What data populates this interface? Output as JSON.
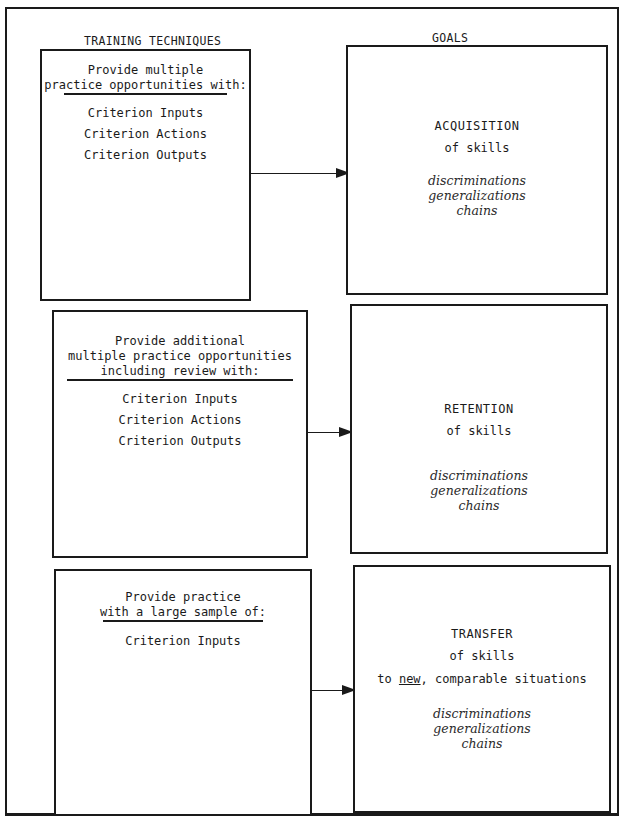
{
  "headers": {
    "left": "TRAINING TECHNIQUES",
    "right": "GOALS"
  },
  "rows": [
    {
      "technique": {
        "intro_lines": [
          "Provide multiple",
          "practice opportunities with:"
        ],
        "items": [
          "Criterion Inputs",
          "Criterion Actions",
          "Criterion Outputs"
        ]
      },
      "goal": {
        "title": "ACQUISITION",
        "subtitle": "of skills",
        "extra": "",
        "skill_types": [
          "discriminations",
          "generalizations",
          "chains"
        ]
      }
    },
    {
      "technique": {
        "intro_lines": [
          "Provide additional",
          "multiple practice opportunities",
          "including review with:"
        ],
        "items": [
          "Criterion Inputs",
          "Criterion Actions",
          "Criterion Outputs"
        ]
      },
      "goal": {
        "title": "RETENTION",
        "subtitle": "of skills",
        "extra": "",
        "skill_types": [
          "discriminations",
          "generalizations",
          "chains"
        ]
      }
    },
    {
      "technique": {
        "intro_lines": [
          "Provide practice",
          "with a large sample of:"
        ],
        "items": [
          "Criterion Inputs"
        ]
      },
      "goal": {
        "title": "TRANSFER",
        "subtitle": "of skills",
        "extra_prefix": "to ",
        "extra_underlined": "new",
        "extra_suffix": ", comparable situations",
        "skill_types": [
          "discriminations",
          "generalizations",
          "chains"
        ]
      }
    }
  ]
}
